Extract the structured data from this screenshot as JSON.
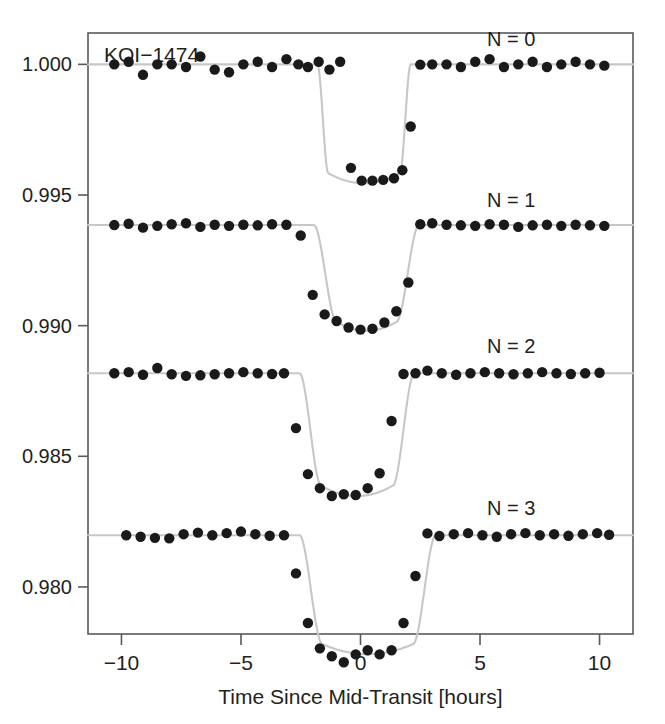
{
  "figure": {
    "annotation": "KOI-1474",
    "background_color": "#ffffff",
    "frame_color": "#58595b",
    "point_color": "#1a1a1a",
    "model_color": "#c6c7c9"
  },
  "chart_data": {
    "type": "scatter",
    "xlabel": "Time Since Mid-Transit [hours]",
    "ylabel": "",
    "xlim": [
      -11.4,
      11.4
    ],
    "ylim": [
      0.9782,
      1.0012
    ],
    "grid": false,
    "legend_position": "inline-right",
    "xticks": [
      -10,
      -5,
      0,
      5,
      10
    ],
    "xtick_labels": [
      "-10",
      "-5",
      "0",
      "5",
      "10"
    ],
    "yticks": [
      1.0,
      0.995,
      0.99,
      0.985,
      0.98
    ],
    "ytick_labels": [
      "1.000",
      "0.995",
      "0.990",
      "0.985",
      "0.980"
    ],
    "series": [
      {
        "name": "N = 0",
        "label": "N = 0",
        "label_x": 6.3,
        "label_y": 1.0007,
        "baseline": 1.0,
        "depth": 0.00455,
        "center": 0.15,
        "half_duration": 1.95,
        "ingress": 0.45,
        "x": [
          -10.3,
          -9.7,
          -9.1,
          -8.5,
          -7.9,
          -7.3,
          -6.7,
          -6.1,
          -5.5,
          -4.9,
          -4.3,
          -3.7,
          -3.1,
          -2.6,
          -2.2,
          -1.75,
          -1.3,
          -0.85,
          -0.4,
          0.05,
          0.5,
          0.95,
          1.4,
          1.75,
          2.1,
          2.5,
          3.0,
          3.6,
          4.2,
          4.8,
          5.4,
          6.0,
          6.6,
          7.2,
          7.8,
          8.4,
          9.0,
          9.6,
          10.2
        ],
        "y": [
          1.0,
          1.0001,
          0.9996,
          1.0,
          1.0,
          0.9999,
          1.0003,
          0.9998,
          0.9997,
          1.0,
          1.0001,
          0.9999,
          1.0002,
          1.0,
          0.9999,
          1.0001,
          0.9998,
          1.0001,
          0.99604,
          0.99555,
          0.99555,
          0.99558,
          0.99564,
          0.99595,
          0.99762,
          0.99999,
          1.0,
          1.0,
          0.9999,
          1.0001,
          1.0002,
          0.9999,
          1.0,
          1.0001,
          0.9999,
          1.0,
          1.0001,
          1.0,
          0.99995
        ]
      },
      {
        "name": "N = 1",
        "label": "N = 1",
        "label_x": 6.3,
        "label_y": 0.99455,
        "baseline": 0.99385,
        "depth": 0.00405,
        "center": 0.25,
        "half_duration": 2.2,
        "ingress": 0.95,
        "x": [
          -10.3,
          -9.7,
          -9.1,
          -8.5,
          -7.9,
          -7.3,
          -6.7,
          -6.1,
          -5.5,
          -4.9,
          -4.3,
          -3.7,
          -3.1,
          -2.5,
          -2.0,
          -1.5,
          -1.0,
          -0.5,
          0.0,
          0.5,
          1.0,
          1.5,
          2.0,
          2.5,
          3.0,
          3.6,
          4.2,
          4.8,
          5.4,
          6.0,
          6.6,
          7.2,
          7.8,
          8.4,
          9.0,
          9.6,
          10.2
        ],
        "y": [
          0.99385,
          0.9939,
          0.99375,
          0.99382,
          0.99388,
          0.99392,
          0.99378,
          0.99386,
          0.99382,
          0.99386,
          0.99384,
          0.99388,
          0.99386,
          0.99345,
          0.99118,
          0.99043,
          0.99018,
          0.98993,
          0.98985,
          0.98988,
          0.99012,
          0.99055,
          0.99165,
          0.99388,
          0.99392,
          0.99386,
          0.99384,
          0.99382,
          0.99388,
          0.99386,
          0.99378,
          0.99384,
          0.99386,
          0.99382,
          0.99386,
          0.99384,
          0.99382
        ]
      },
      {
        "name": "N = 2",
        "label": "N = 2",
        "label_x": 6.3,
        "label_y": 0.98895,
        "baseline": 0.98818,
        "depth": 0.0047,
        "center": -0.15,
        "half_duration": 2.4,
        "ingress": 0.9,
        "x": [
          -10.3,
          -9.7,
          -9.1,
          -8.5,
          -7.9,
          -7.3,
          -6.7,
          -6.1,
          -5.5,
          -4.9,
          -4.3,
          -3.7,
          -3.2,
          -2.7,
          -2.2,
          -1.7,
          -1.2,
          -0.7,
          -0.2,
          0.3,
          0.8,
          1.3,
          1.8,
          2.3,
          2.8,
          3.4,
          4.0,
          4.6,
          5.2,
          5.8,
          6.4,
          7.0,
          7.6,
          8.2,
          8.8,
          9.4,
          10.0
        ],
        "y": [
          0.98818,
          0.98822,
          0.98812,
          0.98838,
          0.98814,
          0.98808,
          0.9881,
          0.98814,
          0.98818,
          0.98822,
          0.98818,
          0.98815,
          0.98818,
          0.98608,
          0.98432,
          0.98378,
          0.98348,
          0.98355,
          0.98352,
          0.98378,
          0.98435,
          0.98635,
          0.98815,
          0.98818,
          0.98828,
          0.98818,
          0.98812,
          0.98818,
          0.98822,
          0.98818,
          0.98814,
          0.98818,
          0.98822,
          0.98818,
          0.98815,
          0.98818,
          0.9882
        ]
      },
      {
        "name": "N = 3",
        "label": "N = 3",
        "label_x": 6.3,
        "label_y": 0.98275,
        "baseline": 0.98198,
        "depth": 0.00455,
        "center": 0.3,
        "half_duration": 2.85,
        "ingress": 0.95,
        "x": [
          -9.8,
          -9.2,
          -8.6,
          -8.0,
          -7.4,
          -6.8,
          -6.2,
          -5.6,
          -5.0,
          -4.4,
          -3.8,
          -3.2,
          -2.7,
          -2.2,
          -1.7,
          -1.2,
          -0.7,
          -0.2,
          0.3,
          0.8,
          1.3,
          1.8,
          2.3,
          2.8,
          3.3,
          3.9,
          4.5,
          5.1,
          5.7,
          6.3,
          6.9,
          7.5,
          8.1,
          8.7,
          9.3,
          9.9,
          10.4
        ],
        "y": [
          0.98198,
          0.98192,
          0.98188,
          0.98186,
          0.98202,
          0.98208,
          0.98198,
          0.98206,
          0.98212,
          0.98202,
          0.98196,
          0.98198,
          0.98052,
          0.97862,
          0.97765,
          0.97735,
          0.97712,
          0.97742,
          0.97758,
          0.97742,
          0.97758,
          0.97862,
          0.98042,
          0.98205,
          0.98195,
          0.98202,
          0.98206,
          0.98198,
          0.98192,
          0.98202,
          0.98206,
          0.98198,
          0.98202,
          0.98196,
          0.98202,
          0.98206,
          0.982
        ]
      }
    ]
  }
}
